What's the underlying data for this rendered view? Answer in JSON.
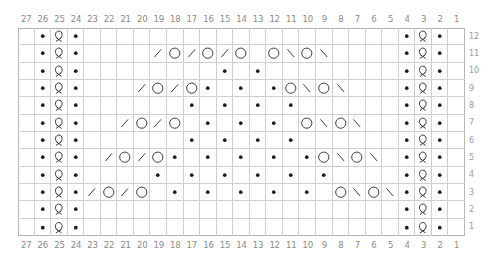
{
  "chart": {
    "columns": 27,
    "rows": 12,
    "column_labels": [
      "27",
      "26",
      "25",
      "24",
      "23",
      "22",
      "21",
      "20",
      "19",
      "18",
      "17",
      "16",
      "15",
      "14",
      "13",
      "12",
      "11",
      "10",
      "9",
      "8",
      "7",
      "6",
      "5",
      "4",
      "3",
      "2",
      "1"
    ],
    "row_labels": [
      "12",
      "11",
      "10",
      "9",
      "8",
      "7",
      "6",
      "5",
      "4",
      "3",
      "2",
      "1"
    ],
    "colors": {
      "grid_line": "#cfcfcf",
      "grid_border": "#b5b5b5",
      "symbol": "#1a1a1a",
      "symbol_stroke": "#333333",
      "label": "#8a8a8a"
    },
    "symbol_legend": {
      "purl": "dot",
      "twisted_knit": "loop",
      "yarn_over": "circle",
      "k2tog": "slash",
      "ssk": "backslash",
      "knit": "empty"
    },
    "side_panels": {
      "columns": {
        "26": "purl",
        "25": "twisted_knit",
        "24": "purl",
        "4": "purl",
        "3": "twisted_knit",
        "2": "purl"
      },
      "all_rows": true
    },
    "rows_content": {
      "12": {},
      "11": {
        "19": "k2tog",
        "18": "yarn_over",
        "17": "k2tog",
        "16": "yarn_over",
        "15": "k2tog",
        "14": "yarn_over",
        "12": "yarn_over",
        "11": "ssk",
        "10": "yarn_over",
        "9": "ssk"
      },
      "10": {
        "15": "purl",
        "13": "purl"
      },
      "9": {
        "20": "k2tog",
        "19": "yarn_over",
        "18": "k2tog",
        "17": "yarn_over",
        "16": "purl",
        "14": "purl",
        "12": "purl",
        "11": "yarn_over",
        "10": "ssk",
        "9": "yarn_over",
        "8": "ssk"
      },
      "8": {
        "17": "purl",
        "15": "purl",
        "13": "purl",
        "11": "purl"
      },
      "7": {
        "21": "k2tog",
        "20": "yarn_over",
        "19": "k2tog",
        "18": "yarn_over",
        "16": "purl",
        "14": "purl",
        "12": "purl",
        "10": "yarn_over",
        "9": "ssk",
        "8": "yarn_over",
        "7": "ssk"
      },
      "6": {
        "17": "purl",
        "15": "purl",
        "13": "purl",
        "11": "purl"
      },
      "5": {
        "22": "k2tog",
        "21": "yarn_over",
        "20": "k2tog",
        "19": "yarn_over",
        "18": "purl",
        "16": "purl",
        "14": "purl",
        "12": "purl",
        "10": "purl",
        "9": "yarn_over",
        "8": "ssk",
        "7": "yarn_over",
        "6": "ssk"
      },
      "4": {
        "19": "purl",
        "17": "purl",
        "15": "purl",
        "13": "purl",
        "11": "purl",
        "9": "purl"
      },
      "3": {
        "23": "k2tog",
        "22": "yarn_over",
        "21": "k2tog",
        "20": "yarn_over",
        "18": "purl",
        "16": "purl",
        "14": "purl",
        "12": "purl",
        "10": "purl",
        "8": "yarn_over",
        "7": "ssk",
        "6": "yarn_over",
        "5": "ssk"
      },
      "2": {},
      "1": {}
    }
  }
}
